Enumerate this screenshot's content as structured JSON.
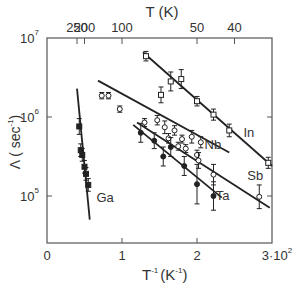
{
  "chart_data": {
    "type": "scatter",
    "title": "",
    "xlabel": "T⁻¹ (K⁻¹)",
    "ylabel": "Λ (sec⁻¹)",
    "top_xlabel": "T (K)",
    "xlim": [
      0,
      3
    ],
    "x_scale_note": "×10⁻²",
    "ylim_log10": [
      4.4,
      7
    ],
    "yscale": "log",
    "grid": false,
    "x_ticks": [
      {
        "value": 0,
        "label": "0"
      },
      {
        "value": 1,
        "label": "1"
      },
      {
        "value": 2,
        "label": "2"
      },
      {
        "value": 3,
        "label": "3·10²"
      }
    ],
    "y_ticks": [
      {
        "log": 7,
        "label": "10",
        "exp": "7"
      },
      {
        "log": 6,
        "label": "10",
        "exp": "6"
      },
      {
        "log": 5,
        "label": "10",
        "exp": "5"
      }
    ],
    "top_ticks": [
      {
        "T": 250,
        "x": 0.4,
        "label": "250"
      },
      {
        "T": 200,
        "x": 0.5,
        "label": "200"
      },
      {
        "T": 100,
        "x": 1.0,
        "label": "100"
      },
      {
        "T": 50,
        "x": 2.0,
        "label": "50"
      },
      {
        "T": 40,
        "x": 2.5,
        "label": "40"
      }
    ],
    "series": [
      {
        "name": "In",
        "marker": "open-square",
        "fit": [
          [
            1.28,
            6.82
          ],
          [
            3.0,
            5.38
          ]
        ],
        "label_pos": [
          2.62,
          5.75
        ],
        "points": [
          {
            "x": 1.32,
            "y": 6.77,
            "err": 0.06
          },
          {
            "x": 1.52,
            "y": 6.28,
            "err": 0.1
          },
          {
            "x": 1.65,
            "y": 6.45,
            "err": 0.12
          },
          {
            "x": 1.79,
            "y": 6.48,
            "err": 0.12
          },
          {
            "x": 2.0,
            "y": 6.2,
            "err": 0.06
          },
          {
            "x": 2.22,
            "y": 6.03,
            "err": 0.07
          },
          {
            "x": 2.43,
            "y": 5.83,
            "err": 0.08
          },
          {
            "x": 2.95,
            "y": 5.42,
            "err": 0.07
          }
        ]
      },
      {
        "name": "Nb",
        "marker": "open-circle",
        "fit": [
          [
            0.68,
            6.46
          ],
          [
            2.43,
            5.55
          ]
        ],
        "label_pos": [
          2.1,
          5.6
        ],
        "points": [
          {
            "x": 0.73,
            "y": 6.27,
            "err": 0.04
          },
          {
            "x": 0.82,
            "y": 6.27,
            "err": 0.04
          },
          {
            "x": 0.97,
            "y": 6.1,
            "err": 0.04
          },
          {
            "x": 1.47,
            "y": 5.96,
            "err": 0.06
          },
          {
            "x": 1.57,
            "y": 5.87,
            "err": 0.08
          },
          {
            "x": 1.7,
            "y": 5.83,
            "err": 0.06
          },
          {
            "x": 1.8,
            "y": 5.72,
            "err": 0.05
          },
          {
            "x": 1.93,
            "y": 5.75,
            "err": 0.08
          },
          {
            "x": 2.05,
            "y": 5.68,
            "err": 0.07
          }
        ]
      },
      {
        "name": "Sb",
        "marker": "open-circle",
        "fit": [
          [
            1.2,
            5.93
          ],
          [
            2.97,
            4.85
          ]
        ],
        "label_pos": [
          2.67,
          5.2
        ],
        "points": [
          {
            "x": 1.3,
            "y": 5.93,
            "err": 0.05
          },
          {
            "x": 1.62,
            "y": 5.73,
            "err": 0.06
          },
          {
            "x": 1.75,
            "y": 5.63,
            "err": 0.05
          },
          {
            "x": 1.85,
            "y": 5.6,
            "err": 0.05
          },
          {
            "x": 2.0,
            "y": 5.52,
            "err": 0.06
          },
          {
            "x": 2.02,
            "y": 5.45,
            "err": 0.1
          },
          {
            "x": 2.22,
            "y": 5.27,
            "err": 0.13
          },
          {
            "x": 2.83,
            "y": 4.99,
            "err": 0.15
          }
        ]
      },
      {
        "name": "Ta",
        "marker": "filled-circle",
        "fit": [
          [
            1.15,
            5.9
          ],
          [
            2.33,
            4.98
          ]
        ],
        "label_pos": [
          2.25,
          4.95
        ],
        "points": [
          {
            "x": 1.25,
            "y": 5.8,
            "err": 0.12
          },
          {
            "x": 1.43,
            "y": 5.7,
            "err": 0.1
          },
          {
            "x": 1.55,
            "y": 5.5,
            "err": 0.12
          },
          {
            "x": 1.65,
            "y": 5.62,
            "err": 0.12
          },
          {
            "x": 1.83,
            "y": 5.38,
            "err": 0.12
          },
          {
            "x": 2.0,
            "y": 5.15,
            "err": 0.25
          },
          {
            "x": 2.22,
            "y": 5.0,
            "err": 0.18
          }
        ]
      },
      {
        "name": "Ga",
        "marker": "filled-square",
        "fit": [
          [
            0.4,
            6.36
          ],
          [
            0.57,
            4.7
          ]
        ],
        "label_pos": [
          0.66,
          4.93
        ],
        "points": [
          {
            "x": 0.43,
            "y": 5.88,
            "err": 0.1
          },
          {
            "x": 0.45,
            "y": 5.58,
            "err": 0.08
          },
          {
            "x": 0.47,
            "y": 5.52,
            "err": 0.08
          },
          {
            "x": 0.5,
            "y": 5.37,
            "err": 0.08
          },
          {
            "x": 0.52,
            "y": 5.28,
            "err": 0.08
          },
          {
            "x": 0.55,
            "y": 5.14,
            "err": 0.08
          }
        ]
      }
    ]
  },
  "axes": {
    "top_title": "T (K)",
    "bottom_title_main": "T",
    "bottom_title_exp": "-1",
    "bottom_title_unit": "(K",
    "bottom_title_unit_exp": "-1",
    "bottom_title_close": ")",
    "left_title": "Λ ( sec",
    "left_title_exp": "-1",
    "left_title_close": ")"
  }
}
